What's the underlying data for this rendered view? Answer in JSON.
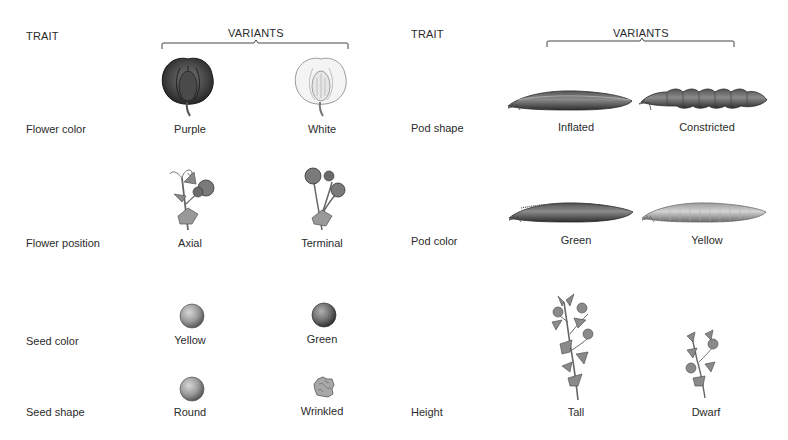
{
  "left_panel": {
    "header_trait": "TRAIT",
    "header_variants": "VARIANTS",
    "rows": [
      {
        "trait": "Flower color",
        "variants": [
          {
            "label": "Purple",
            "icon": "purple-flower-icon"
          },
          {
            "label": "White",
            "icon": "white-flower-icon"
          }
        ]
      },
      {
        "trait": "Flower position",
        "variants": [
          {
            "label": "Axial",
            "icon": "axial-flower-stem-icon"
          },
          {
            "label": "Terminal",
            "icon": "terminal-flower-stem-icon"
          }
        ]
      },
      {
        "trait": "Seed color",
        "variants": [
          {
            "label": "Yellow",
            "icon": "yellow-seed-icon"
          },
          {
            "label": "Green",
            "icon": "green-seed-icon"
          }
        ]
      },
      {
        "trait": "Seed shape",
        "variants": [
          {
            "label": "Round",
            "icon": "round-seed-icon"
          },
          {
            "label": "Wrinkled",
            "icon": "wrinkled-seed-icon"
          }
        ]
      }
    ]
  },
  "right_panel": {
    "header_trait": "TRAIT",
    "header_variants": "VARIANTS",
    "rows": [
      {
        "trait": "Pod shape",
        "variants": [
          {
            "label": "Inflated",
            "icon": "inflated-pod-icon"
          },
          {
            "label": "Constricted",
            "icon": "constricted-pod-icon"
          }
        ]
      },
      {
        "trait": "Pod color",
        "variants": [
          {
            "label": "Green",
            "icon": "green-pod-icon"
          },
          {
            "label": "Yellow",
            "icon": "yellow-pod-icon"
          }
        ]
      },
      {
        "trait": "Height",
        "variants": [
          {
            "label": "Tall",
            "icon": "tall-plant-icon"
          },
          {
            "label": "Dwarf",
            "icon": "dwarf-plant-icon"
          }
        ]
      }
    ]
  },
  "colors": {
    "text": "#2b2b2b",
    "dark_gray": "#555555",
    "light_gray": "#d8d8d8",
    "background": "#ffffff"
  }
}
